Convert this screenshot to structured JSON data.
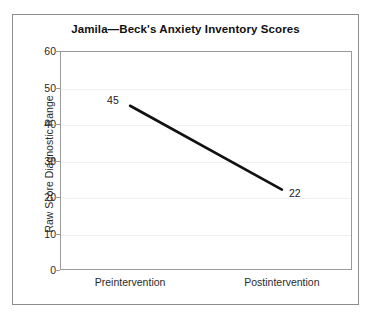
{
  "chart_data": {
    "type": "line",
    "title": "Jamila—Beck's Anxiety Inventory Scores",
    "xlabel": "",
    "ylabel": "Raw Score Diagnostic Range",
    "categories": [
      "Preintervention",
      "Postintervention"
    ],
    "values": [
      45,
      22
    ],
    "point_labels": [
      "45",
      "22"
    ],
    "series": [
      {
        "name": "Jamila",
        "values": [
          45,
          22
        ]
      }
    ],
    "ylim": [
      0,
      60
    ],
    "ytick_labels": [
      "60",
      "50",
      "40",
      "30",
      "20",
      "10",
      "0"
    ],
    "ytick_values": [
      60,
      50,
      40,
      30,
      20,
      10,
      0
    ],
    "ytick_step": 10,
    "grid": true,
    "grid_axis": "y",
    "legend": "none",
    "line_color": "#111111",
    "axis_color": "#9a9a9a",
    "grid_color": "#f0f0f0",
    "frame_color": "#8d8d8d",
    "background": "#ffffff"
  }
}
